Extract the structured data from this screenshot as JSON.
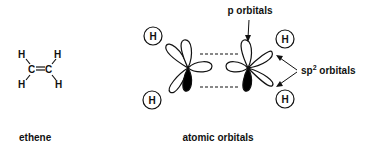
{
  "diagram": {
    "ethene": {
      "caption": "ethene",
      "atoms": {
        "h_top_left": "H",
        "h_top_right": "H",
        "h_bottom_left": "H",
        "h_bottom_right": "H",
        "c_left": "C",
        "c_right": "C",
        "bond": "="
      }
    },
    "atomic_orbitals": {
      "caption": "atomic orbitals",
      "hydrogens": [
        "H",
        "H",
        "H",
        "H"
      ],
      "p_orbitals_label": "p orbitals",
      "sp2_label_main": "sp",
      "sp2_label_sup": "2",
      "sp2_label_rest": " orbitals"
    },
    "colors": {
      "stroke": "#111111",
      "fill_dark": "#000000",
      "background": "#ffffff"
    }
  }
}
